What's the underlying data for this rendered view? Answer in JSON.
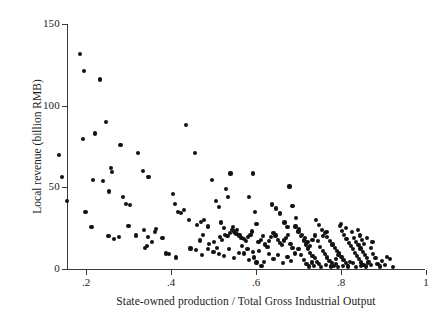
{
  "figure": {
    "background_color": "#ffffff",
    "point_color": "#121212",
    "axis_color": "#3a3a3a"
  },
  "axes": {
    "x_title": "State-owned production / Total Gross Industrial Output",
    "y_title": "Local revenue (billion RMB)",
    "x_ticks": [
      ".2",
      ".4",
      ".6",
      ".8",
      "1"
    ],
    "y_ticks": [
      "150",
      "100",
      "50",
      "0"
    ]
  },
  "chart_data": {
    "type": "scatter",
    "title": "",
    "xlabel": "State-owned production / Total Gross Industrial Output",
    "ylabel": "Local revenue (billion RMB)",
    "xlim": [
      0.13,
      1.0
    ],
    "ylim": [
      0,
      150
    ],
    "xticks": [
      0.2,
      0.4,
      0.6,
      0.8,
      1.0
    ],
    "xticklabels": [
      ".2",
      ".4",
      ".6",
      ".8",
      "1"
    ],
    "yticks": [
      0,
      50,
      100,
      150
    ],
    "yticklabels": [
      "0",
      "50",
      "100",
      "150"
    ],
    "grid": false,
    "legend": false,
    "marker": "filled-circle",
    "marker_color": "#121212",
    "n_points": 232,
    "points": [
      [
        0.186,
        131.6
      ],
      [
        0.196,
        121.0
      ],
      [
        0.232,
        116.0
      ],
      [
        0.137,
        70.0
      ],
      [
        0.144,
        56.5
      ],
      [
        0.156,
        41.5
      ],
      [
        0.193,
        79.5
      ],
      [
        0.199,
        35.0
      ],
      [
        0.222,
        83.0
      ],
      [
        0.216,
        54.5
      ],
      [
        0.247,
        90.0
      ],
      [
        0.24,
        54.0
      ],
      [
        0.255,
        47.5
      ],
      [
        0.259,
        62.0
      ],
      [
        0.261,
        59.5
      ],
      [
        0.281,
        76.0
      ],
      [
        0.288,
        44.0
      ],
      [
        0.295,
        40.0
      ],
      [
        0.303,
        39.0
      ],
      [
        0.323,
        71.0
      ],
      [
        0.335,
        60.0
      ],
      [
        0.347,
        56.5
      ],
      [
        0.3,
        26.5
      ],
      [
        0.318,
        20.5
      ],
      [
        0.337,
        24.0
      ],
      [
        0.345,
        19.5
      ],
      [
        0.343,
        14.0
      ],
      [
        0.338,
        13.0
      ],
      [
        0.355,
        16.5
      ],
      [
        0.363,
        22.5
      ],
      [
        0.364,
        24.5
      ],
      [
        0.38,
        19.0
      ],
      [
        0.213,
        25.5
      ],
      [
        0.253,
        20.0
      ],
      [
        0.265,
        18.5
      ],
      [
        0.277,
        19.5
      ],
      [
        0.389,
        9.5
      ],
      [
        0.396,
        9.0
      ],
      [
        0.404,
        46.0
      ],
      [
        0.41,
        40.0
      ],
      [
        0.417,
        35.0
      ],
      [
        0.423,
        34.5
      ],
      [
        0.43,
        36.0
      ],
      [
        0.436,
        88.0
      ],
      [
        0.443,
        30.0
      ],
      [
        0.457,
        71.0
      ],
      [
        0.462,
        27.0
      ],
      [
        0.47,
        29.0
      ],
      [
        0.478,
        30.0
      ],
      [
        0.487,
        26.0
      ],
      [
        0.412,
        7.0
      ],
      [
        0.446,
        12.5
      ],
      [
        0.458,
        11.5
      ],
      [
        0.497,
        54.5
      ],
      [
        0.506,
        41.5
      ],
      [
        0.512,
        38.0
      ],
      [
        0.518,
        28.5
      ],
      [
        0.524,
        25.0
      ],
      [
        0.529,
        49.0
      ],
      [
        0.534,
        44.0
      ],
      [
        0.54,
        58.5
      ],
      [
        0.546,
        25.5
      ],
      [
        0.551,
        22.0
      ],
      [
        0.556,
        24.0
      ],
      [
        0.502,
        16.5
      ],
      [
        0.509,
        13.0
      ],
      [
        0.516,
        19.5
      ],
      [
        0.52,
        18.0
      ],
      [
        0.528,
        21.0
      ],
      [
        0.533,
        20.0
      ],
      [
        0.538,
        22.0
      ],
      [
        0.543,
        24.0
      ],
      [
        0.549,
        23.0
      ],
      [
        0.554,
        21.5
      ],
      [
        0.561,
        20.5
      ],
      [
        0.566,
        19.0
      ],
      [
        0.571,
        18.5
      ],
      [
        0.576,
        17.0
      ],
      [
        0.582,
        19.5
      ],
      [
        0.587,
        21.0
      ],
      [
        0.59,
        23.0
      ],
      [
        0.583,
        44.0
      ],
      [
        0.592,
        58.5
      ],
      [
        0.597,
        35.0
      ],
      [
        0.601,
        27.5
      ],
      [
        0.606,
        16.5
      ],
      [
        0.611,
        18.0
      ],
      [
        0.616,
        20.0
      ],
      [
        0.622,
        15.0
      ],
      [
        0.627,
        13.5
      ],
      [
        0.631,
        17.0
      ],
      [
        0.636,
        19.5
      ],
      [
        0.641,
        22.0
      ],
      [
        0.646,
        20.5
      ],
      [
        0.651,
        18.0
      ],
      [
        0.656,
        16.0
      ],
      [
        0.661,
        14.5
      ],
      [
        0.666,
        17.5
      ],
      [
        0.671,
        19.0
      ],
      [
        0.676,
        21.0
      ],
      [
        0.681,
        15.5
      ],
      [
        0.686,
        13.0
      ],
      [
        0.512,
        9.0
      ],
      [
        0.525,
        8.0
      ],
      [
        0.537,
        12.0
      ],
      [
        0.548,
        6.5
      ],
      [
        0.56,
        10.0
      ],
      [
        0.572,
        9.5
      ],
      [
        0.584,
        5.5
      ],
      [
        0.596,
        7.0
      ],
      [
        0.608,
        11.0
      ],
      [
        0.619,
        4.5
      ],
      [
        0.63,
        9.0
      ],
      [
        0.641,
        6.0
      ],
      [
        0.652,
        8.5
      ],
      [
        0.663,
        3.5
      ],
      [
        0.674,
        7.5
      ],
      [
        0.683,
        5.0
      ],
      [
        0.691,
        9.5
      ],
      [
        0.638,
        39.5
      ],
      [
        0.648,
        37.0
      ],
      [
        0.657,
        34.0
      ],
      [
        0.667,
        28.5
      ],
      [
        0.674,
        25.5
      ],
      [
        0.679,
        50.5
      ],
      [
        0.686,
        38.5
      ],
      [
        0.693,
        26.0
      ],
      [
        0.7,
        23.0
      ],
      [
        0.706,
        20.0
      ],
      [
        0.712,
        17.5
      ],
      [
        0.717,
        15.0
      ],
      [
        0.722,
        12.5
      ],
      [
        0.728,
        10.0
      ],
      [
        0.733,
        8.0
      ],
      [
        0.738,
        6.5
      ],
      [
        0.743,
        4.5
      ],
      [
        0.748,
        3.0
      ],
      [
        0.694,
        31.0
      ],
      [
        0.702,
        24.5
      ],
      [
        0.709,
        21.0
      ],
      [
        0.715,
        19.0
      ],
      [
        0.721,
        16.5
      ],
      [
        0.727,
        14.0
      ],
      [
        0.733,
        18.0
      ],
      [
        0.739,
        20.5
      ],
      [
        0.745,
        17.0
      ],
      [
        0.751,
        13.5
      ],
      [
        0.757,
        11.0
      ],
      [
        0.762,
        9.0
      ],
      [
        0.768,
        7.0
      ],
      [
        0.773,
        5.0
      ],
      [
        0.779,
        3.5
      ],
      [
        0.784,
        2.0
      ],
      [
        0.789,
        6.0
      ],
      [
        0.794,
        8.5
      ],
      [
        0.742,
        30.0
      ],
      [
        0.749,
        27.0
      ],
      [
        0.756,
        24.0
      ],
      [
        0.762,
        22.0
      ],
      [
        0.768,
        19.5
      ],
      [
        0.774,
        17.0
      ],
      [
        0.78,
        15.0
      ],
      [
        0.785,
        13.0
      ],
      [
        0.791,
        11.0
      ],
      [
        0.796,
        9.5
      ],
      [
        0.801,
        7.5
      ],
      [
        0.806,
        5.5
      ],
      [
        0.811,
        3.5
      ],
      [
        0.816,
        2.0
      ],
      [
        0.821,
        4.5
      ],
      [
        0.797,
        26.5
      ],
      [
        0.803,
        23.5
      ],
      [
        0.808,
        21.0
      ],
      [
        0.813,
        18.5
      ],
      [
        0.818,
        16.0
      ],
      [
        0.823,
        14.0
      ],
      [
        0.828,
        12.0
      ],
      [
        0.833,
        10.0
      ],
      [
        0.838,
        8.0
      ],
      [
        0.843,
        6.0
      ],
      [
        0.848,
        4.0
      ],
      [
        0.853,
        2.5
      ],
      [
        0.826,
        22.5
      ],
      [
        0.831,
        19.0
      ],
      [
        0.836,
        16.5
      ],
      [
        0.841,
        14.5
      ],
      [
        0.846,
        12.5
      ],
      [
        0.851,
        10.5
      ],
      [
        0.856,
        8.5
      ],
      [
        0.861,
        6.5
      ],
      [
        0.866,
        4.5
      ],
      [
        0.871,
        2.5
      ],
      [
        0.84,
        24.0
      ],
      [
        0.845,
        20.5
      ],
      [
        0.85,
        18.0
      ],
      [
        0.855,
        15.5
      ],
      [
        0.8,
        27.5
      ],
      [
        0.812,
        25.0
      ],
      [
        0.758,
        20.0
      ],
      [
        0.766,
        22.5
      ],
      [
        0.7,
        12.0
      ],
      [
        0.706,
        8.5
      ],
      [
        0.713,
        5.5
      ],
      [
        0.719,
        3.0
      ],
      [
        0.725,
        1.5
      ],
      [
        0.731,
        4.0
      ],
      [
        0.737,
        2.0
      ],
      [
        0.752,
        1.0
      ],
      [
        0.764,
        2.5
      ],
      [
        0.776,
        1.5
      ],
      [
        0.788,
        3.0
      ],
      [
        0.793,
        1.0
      ],
      [
        0.805,
        2.0
      ],
      [
        0.817,
        1.5
      ],
      [
        0.829,
        3.5
      ],
      [
        0.835,
        1.0
      ],
      [
        0.847,
        2.0
      ],
      [
        0.858,
        1.5
      ],
      [
        0.864,
        4.0
      ],
      [
        0.876,
        9.0
      ],
      [
        0.881,
        6.5
      ],
      [
        0.886,
        3.0
      ],
      [
        0.891,
        1.5
      ],
      [
        0.897,
        5.0
      ],
      [
        0.903,
        2.5
      ],
      [
        0.909,
        7.5
      ],
      [
        0.915,
        6.0
      ],
      [
        0.922,
        1.0
      ],
      [
        0.87,
        13.0
      ],
      [
        0.874,
        16.5
      ],
      [
        0.862,
        19.0
      ],
      [
        0.601,
        4.0
      ],
      [
        0.613,
        2.0
      ],
      [
        0.487,
        12.0
      ],
      [
        0.472,
        8.5
      ],
      [
        0.5,
        10.5
      ],
      [
        0.468,
        17.5
      ],
      [
        0.476,
        21.0
      ],
      [
        0.49,
        15.5
      ],
      [
        0.58,
        12.0
      ],
      [
        0.567,
        14.0
      ],
      [
        0.593,
        10.5
      ]
    ]
  }
}
